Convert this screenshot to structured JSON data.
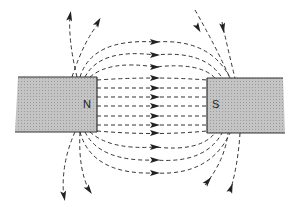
{
  "diagram": {
    "type": "magnetic-field-lines",
    "magnets": [
      {
        "id": "north",
        "label": "N"
      },
      {
        "id": "south",
        "label": "S"
      }
    ],
    "field_direction": "north-to-south",
    "colors": {
      "magnet_fill": "#b8b8b8",
      "line": "#222222",
      "background": "#ffffff"
    }
  }
}
